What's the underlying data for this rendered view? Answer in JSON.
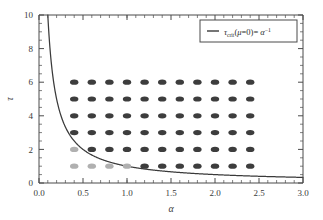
{
  "chart_data": {
    "type": "scatter",
    "title": "",
    "xlabel": "α",
    "ylabel": "τ",
    "xlim": [
      0.0,
      3.0
    ],
    "ylim": [
      0.0,
      10.0
    ],
    "xticks": [
      "0.0",
      "0.5",
      "1.0",
      "1.5",
      "2.0",
      "2.5",
      "3.0"
    ],
    "xtick_values": [
      0.0,
      0.5,
      1.0,
      1.5,
      2.0,
      2.5,
      3.0
    ],
    "yticks": [
      "0",
      "2",
      "4",
      "6",
      "8",
      "10"
    ],
    "ytick_values": [
      0,
      2,
      4,
      6,
      8,
      10
    ],
    "grid": false,
    "legend_position": "top-right",
    "legend": [
      {
        "label_plain": "τ_crit(μ=0) = α^-1",
        "symbol": "line",
        "color": "#3a3a3a"
      }
    ],
    "series": [
      {
        "name": "dark-markers",
        "type": "scatter",
        "color": "#3d3d3d",
        "marker": "ellipse",
        "points": [
          {
            "x": 0.6,
            "y": 2
          },
          {
            "x": 0.8,
            "y": 2
          },
          {
            "x": 1.0,
            "y": 2
          },
          {
            "x": 1.2,
            "y": 2
          },
          {
            "x": 1.4,
            "y": 2
          },
          {
            "x": 1.6,
            "y": 2
          },
          {
            "x": 1.8,
            "y": 2
          },
          {
            "x": 2.0,
            "y": 2
          },
          {
            "x": 2.2,
            "y": 2
          },
          {
            "x": 2.4,
            "y": 2
          },
          {
            "x": 0.4,
            "y": 3
          },
          {
            "x": 0.6,
            "y": 3
          },
          {
            "x": 0.8,
            "y": 3
          },
          {
            "x": 1.0,
            "y": 3
          },
          {
            "x": 1.2,
            "y": 3
          },
          {
            "x": 1.4,
            "y": 3
          },
          {
            "x": 1.6,
            "y": 3
          },
          {
            "x": 1.8,
            "y": 3
          },
          {
            "x": 2.0,
            "y": 3
          },
          {
            "x": 2.2,
            "y": 3
          },
          {
            "x": 2.4,
            "y": 3
          },
          {
            "x": 0.4,
            "y": 4
          },
          {
            "x": 0.6,
            "y": 4
          },
          {
            "x": 0.8,
            "y": 4
          },
          {
            "x": 1.0,
            "y": 4
          },
          {
            "x": 1.2,
            "y": 4
          },
          {
            "x": 1.4,
            "y": 4
          },
          {
            "x": 1.6,
            "y": 4
          },
          {
            "x": 1.8,
            "y": 4
          },
          {
            "x": 2.0,
            "y": 4
          },
          {
            "x": 2.2,
            "y": 4
          },
          {
            "x": 2.4,
            "y": 4
          },
          {
            "x": 0.4,
            "y": 5
          },
          {
            "x": 0.6,
            "y": 5
          },
          {
            "x": 0.8,
            "y": 5
          },
          {
            "x": 1.0,
            "y": 5
          },
          {
            "x": 1.2,
            "y": 5
          },
          {
            "x": 1.4,
            "y": 5
          },
          {
            "x": 1.6,
            "y": 5
          },
          {
            "x": 1.8,
            "y": 5
          },
          {
            "x": 2.0,
            "y": 5
          },
          {
            "x": 2.2,
            "y": 5
          },
          {
            "x": 2.4,
            "y": 5
          },
          {
            "x": 0.4,
            "y": 6
          },
          {
            "x": 0.6,
            "y": 6
          },
          {
            "x": 0.8,
            "y": 6
          },
          {
            "x": 1.0,
            "y": 6
          },
          {
            "x": 1.2,
            "y": 6
          },
          {
            "x": 1.4,
            "y": 6
          },
          {
            "x": 1.6,
            "y": 6
          },
          {
            "x": 1.8,
            "y": 6
          },
          {
            "x": 2.0,
            "y": 6
          },
          {
            "x": 2.2,
            "y": 6
          },
          {
            "x": 2.4,
            "y": 6
          },
          {
            "x": 1.2,
            "y": 1
          },
          {
            "x": 1.4,
            "y": 1
          },
          {
            "x": 1.6,
            "y": 1
          },
          {
            "x": 1.8,
            "y": 1
          },
          {
            "x": 2.0,
            "y": 1
          },
          {
            "x": 2.2,
            "y": 1
          },
          {
            "x": 2.4,
            "y": 1
          }
        ]
      },
      {
        "name": "gray-markers",
        "type": "scatter",
        "color": "#b0b0b0",
        "marker": "ellipse",
        "points": [
          {
            "x": 0.4,
            "y": 2
          },
          {
            "x": 0.4,
            "y": 1
          },
          {
            "x": 0.6,
            "y": 1
          },
          {
            "x": 0.8,
            "y": 1
          },
          {
            "x": 1.0,
            "y": 1
          }
        ]
      },
      {
        "name": "tau-crit-curve",
        "type": "line",
        "color": "#3a3a3a",
        "formula": "tau = 1/alpha",
        "x_range": [
          0.1,
          3.0
        ]
      }
    ]
  },
  "legend": {
    "tau": "τ",
    "crit": "crit",
    "open_paren": "(",
    "mu": "μ",
    "eq_zero": "=0",
    "close_paren": ")=",
    "alpha": "α",
    "exponent": "−1"
  },
  "axes": {
    "x_label": "α",
    "y_label": "τ",
    "x_tick_0": "0.0",
    "x_tick_1": "0.5",
    "x_tick_2": "1.0",
    "x_tick_3": "1.5",
    "x_tick_4": "2.0",
    "x_tick_5": "2.5",
    "x_tick_6": "3.0",
    "y_tick_0": "0",
    "y_tick_1": "2",
    "y_tick_2": "4",
    "y_tick_3": "6",
    "y_tick_4": "8",
    "y_tick_5": "10"
  }
}
